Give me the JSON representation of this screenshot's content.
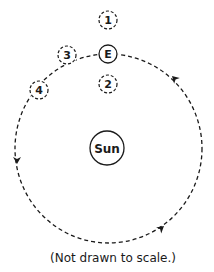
{
  "diagram": {
    "sun": {
      "label": "Sun",
      "cx": 107,
      "cy": 148,
      "r": 17
    },
    "earth": {
      "label": "E",
      "cx": 108,
      "cy": 54,
      "r": 9
    },
    "positions": [
      {
        "label": "1",
        "cx": 108,
        "cy": 20,
        "r": 9
      },
      {
        "label": "2",
        "cx": 108,
        "cy": 84,
        "r": 9
      },
      {
        "label": "3",
        "cx": 67,
        "cy": 55,
        "r": 9
      },
      {
        "label": "4",
        "cx": 39,
        "cy": 90,
        "r": 9
      }
    ],
    "orbit": {
      "cx": 108.5,
      "cy": 148.5,
      "rx": 93.5,
      "ry": 94.5,
      "style": "dashed",
      "direction": "counterclockwise"
    },
    "caption": "(Not drawn to scale.)",
    "colors": {
      "stroke": "#1a1a1a",
      "background": "#ffffff"
    }
  }
}
